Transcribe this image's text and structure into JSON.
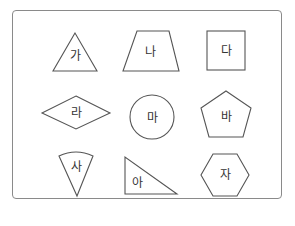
{
  "figure": {
    "colors": {
      "stroke": "#555555",
      "frame": "#8a8a8a",
      "text": "#333333",
      "background": "#ffffff"
    },
    "shapes": [
      {
        "id": "ga",
        "label": "가",
        "shape": "triangle"
      },
      {
        "id": "na",
        "label": "나",
        "shape": "trapezoid"
      },
      {
        "id": "da",
        "label": "다",
        "shape": "square"
      },
      {
        "id": "ra",
        "label": "라",
        "shape": "rhombus"
      },
      {
        "id": "ma",
        "label": "마",
        "shape": "circle"
      },
      {
        "id": "ba",
        "label": "바",
        "shape": "pentagon"
      },
      {
        "id": "sa",
        "label": "사",
        "shape": "circular-sector"
      },
      {
        "id": "a",
        "label": "아",
        "shape": "right-triangle"
      },
      {
        "id": "ja",
        "label": "자",
        "shape": "hexagon"
      }
    ]
  }
}
